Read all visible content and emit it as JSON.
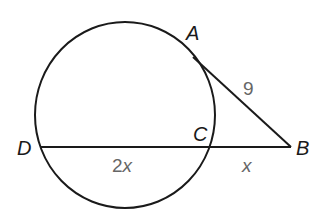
{
  "diagram": {
    "type": "circle-tangent-secant",
    "points": {
      "A": {
        "label": "A"
      },
      "B": {
        "label": "B"
      },
      "C": {
        "label": "C"
      },
      "D": {
        "label": "D"
      }
    },
    "measures": {
      "AB": "9",
      "DC_num": "2",
      "DC_var": "x",
      "CB": "x"
    },
    "colors": {
      "stroke": "#1a1a1a",
      "measure_text": "#666666",
      "background": "#ffffff"
    }
  }
}
